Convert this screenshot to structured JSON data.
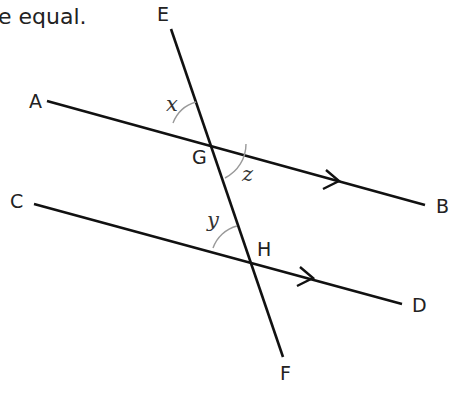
{
  "caption": "e equal.",
  "points": {
    "A": "A",
    "B": "B",
    "C": "C",
    "D": "D",
    "E": "E",
    "F": "F",
    "G": "G",
    "H": "H"
  },
  "angles": {
    "x": "x",
    "y": "y",
    "z": "z"
  },
  "colors": {
    "line": "#111111",
    "arc": "#999999",
    "text": "#222222"
  },
  "lines": [
    {
      "name": "AB",
      "from": [
        47,
        101
      ],
      "to": [
        425,
        205
      ],
      "arrow_at": [
        338,
        181
      ]
    },
    {
      "name": "CD",
      "from": [
        34,
        204
      ],
      "to": [
        402,
        304
      ],
      "arrow_at": [
        311,
        278
      ]
    },
    {
      "name": "EF",
      "from": [
        171,
        29
      ],
      "to": [
        283,
        357
      ]
    }
  ],
  "intersections": {
    "G": [
      207,
      133
    ],
    "H": [
      248,
      258
    ]
  }
}
